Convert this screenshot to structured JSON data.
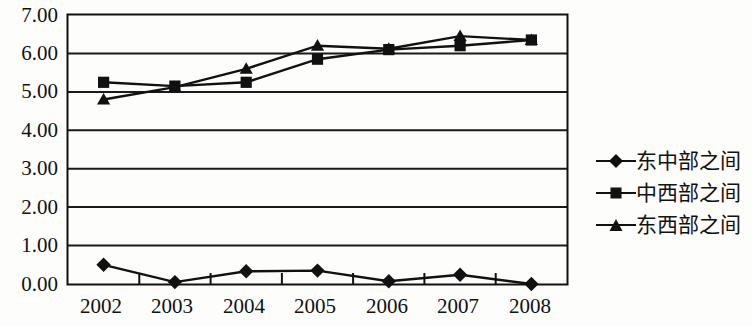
{
  "chart_data": {
    "type": "line",
    "title": "",
    "subtitle": "",
    "xlabel": "",
    "ylabel": "",
    "categories": [
      "2002",
      "2003",
      "2004",
      "2005",
      "2006",
      "2007",
      "2008"
    ],
    "ylim": [
      0.0,
      7.0
    ],
    "ytick_step": 1.0,
    "ytick_labels": [
      "0.00",
      "1.00",
      "2.00",
      "3.00",
      "4.00",
      "5.00",
      "6.00",
      "7.00"
    ],
    "grid": "horizontal",
    "legend_position": "right",
    "plot_border": true,
    "series": [
      {
        "name": "东中部之间",
        "marker": "diamond",
        "color": "#111111",
        "values": [
          0.5,
          0.05,
          0.33,
          0.35,
          0.07,
          0.24,
          0.0
        ]
      },
      {
        "name": "中西部之间",
        "marker": "square",
        "color": "#111111",
        "values": [
          5.25,
          5.15,
          5.25,
          5.85,
          6.1,
          6.2,
          6.35
        ]
      },
      {
        "name": "东西部之间",
        "marker": "triangle",
        "color": "#111111",
        "values": [
          4.8,
          5.12,
          5.6,
          6.2,
          6.12,
          6.45,
          6.35
        ]
      }
    ]
  },
  "legend": {
    "items": [
      {
        "label": "东中部之间",
        "marker": "diamond"
      },
      {
        "label": "中西部之间",
        "marker": "square"
      },
      {
        "label": "东西部之间",
        "marker": "triangle"
      }
    ]
  },
  "colors": {
    "ink": "#111111",
    "background": "#fdfdfb",
    "grid": "#1a1a1a",
    "axis": "#111111"
  }
}
